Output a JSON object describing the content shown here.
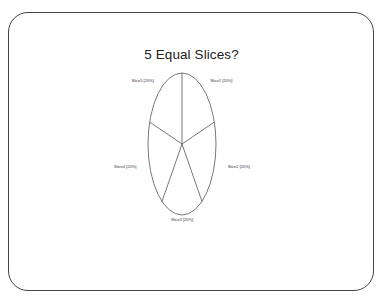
{
  "chart_data": {
    "type": "pie",
    "title": "5 Equal Slices?",
    "categories": [
      "Slice1",
      "Slice2",
      "Slice3",
      "Slice4",
      "Slice5"
    ],
    "values": [
      20,
      20,
      20,
      20,
      20
    ],
    "labels": [
      "Slice1 [20%]",
      "Slice2 [20%]",
      "Slice3 [20%]",
      "Slice4 [20%]",
      "Slice5 [20%]"
    ],
    "legend": "none",
    "start": "top",
    "direction": "clockwise"
  }
}
